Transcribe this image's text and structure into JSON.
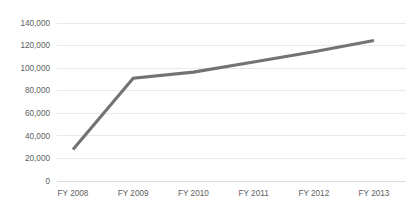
{
  "chart_data": {
    "type": "line",
    "title": "",
    "subtitle": "",
    "xlabel": "",
    "ylabel": "",
    "categories": [
      "FY 2008",
      "FY 2009",
      "FY 2010",
      "FY 2011",
      "FY 2012",
      "FY 2013"
    ],
    "series": [
      {
        "name": "",
        "color": "#737373",
        "values": [
          28000,
          91000,
          96500,
          105500,
          114500,
          124500
        ]
      }
    ],
    "ylim": [
      0,
      140000
    ],
    "ytick_values": [
      0,
      20000,
      40000,
      60000,
      80000,
      100000,
      120000,
      140000
    ],
    "ytick_labels": [
      "0",
      "20,000",
      "40,000",
      "60,000",
      "80,000",
      "100,000",
      "120,000",
      "140,000"
    ],
    "grid": true,
    "grid_axis": "y",
    "legend": false,
    "legend_position": "none",
    "markers": false,
    "colors": {
      "line": "#737373",
      "grid": "#e4e4e4",
      "axis": "#d8d8d8",
      "tick_text": "#5e5e5e",
      "background": "#ffffff"
    }
  }
}
